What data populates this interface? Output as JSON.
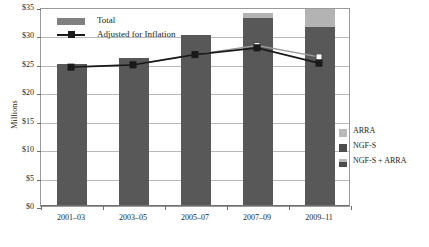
{
  "chart_data": {
    "type": "bar",
    "title": "",
    "subtitle": "",
    "xlabel": "",
    "ylabel": "Millions",
    "ylim": [
      0,
      35
    ],
    "ytick_labels": [
      "$35",
      "$30",
      "$25",
      "$20",
      "$15",
      "$10",
      "$5",
      "$0"
    ],
    "ytick_values": [
      35,
      30,
      25,
      20,
      15,
      10,
      5,
      0
    ],
    "grid": true,
    "categories": [
      "2001–03",
      "2003–05",
      "2005–07",
      "2007–09",
      "2009–11"
    ],
    "series": [
      {
        "name": "NGF-S",
        "type": "bar",
        "stack": "total",
        "color": "#585858",
        "values": [
          25.0,
          26.0,
          30.1,
          33.0,
          31.5
        ]
      },
      {
        "name": "ARRA",
        "type": "bar",
        "stack": "total",
        "color": "#b3b3b3",
        "values": [
          0,
          0,
          0,
          1.0,
          3.2
        ]
      },
      {
        "name": "Adjusted for Inflation",
        "type": "line",
        "color": "#1a1a1a",
        "marker": "square",
        "values": [
          24.6,
          25.0,
          26.8,
          28.0,
          25.3
        ]
      },
      {
        "name": "Adjusted for Inflation including ARRA",
        "type": "line",
        "color": "#8a8a8a",
        "marker": "square-open",
        "values": [
          24.6,
          25.0,
          26.8,
          28.4,
          26.4
        ]
      }
    ],
    "totals": [
      25.0,
      26.0,
      30.1,
      34.0,
      34.7
    ],
    "legend_position": "inside-top-left, outside-right"
  },
  "axis": {
    "y_title": "Millions"
  },
  "inner_legend": {
    "items": [
      {
        "label": "Total",
        "swatch": "bar",
        "color": "#808080"
      },
      {
        "label": "Adjusted for Inflation",
        "swatch": "line-marker",
        "color": "#1a1a1a"
      }
    ]
  },
  "right_legend": {
    "items": [
      {
        "label": "ARRA",
        "swatch": "arra",
        "color": "#b9b9b9"
      },
      {
        "label": "NGF-S",
        "swatch": "ngfs",
        "color": "#4d4d4d"
      },
      {
        "label": "NGF-S + ARRA",
        "swatch": "both",
        "color": "#4d4d4d"
      }
    ]
  }
}
